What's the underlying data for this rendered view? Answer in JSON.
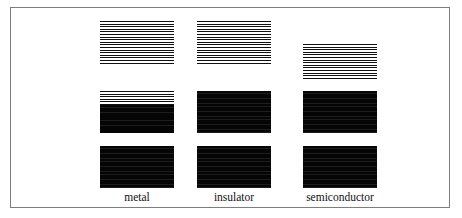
{
  "figure": {
    "type": "energy-band-diagram",
    "frame": {
      "border_color": "#7d7d7d",
      "background": "#ffffff"
    },
    "band_colors": {
      "filled": "#0a0a0a",
      "empty_lines": "#111111",
      "gap": "#ffffff"
    },
    "columns": [
      {
        "id": "metal",
        "label": "metal",
        "x": 89,
        "label_y": 183,
        "bands": [
          {
            "name": "conduction-band",
            "y": 13,
            "height": 44,
            "fill": "empty",
            "fill_fraction": 0.0,
            "stripe_count": 17
          },
          {
            "name": "partially-filled-band",
            "y": 83,
            "height": 42,
            "fill": "partial",
            "fill_fraction": 0.66,
            "stripe_count": 16
          },
          {
            "name": "valence-band",
            "y": 138,
            "height": 42,
            "fill": "filled",
            "fill_fraction": 1.0,
            "stripe_count": 16
          }
        ]
      },
      {
        "id": "insulator",
        "label": "insulator",
        "x": 186,
        "label_y": 183,
        "bands": [
          {
            "name": "conduction-band",
            "y": 13,
            "height": 44,
            "fill": "empty",
            "fill_fraction": 0.0,
            "stripe_count": 17
          },
          {
            "name": "valence-band",
            "y": 83,
            "height": 42,
            "fill": "filled",
            "fill_fraction": 1.0,
            "stripe_count": 16
          },
          {
            "name": "lower-band",
            "y": 138,
            "height": 42,
            "fill": "filled",
            "fill_fraction": 1.0,
            "stripe_count": 16
          }
        ]
      },
      {
        "id": "semiconductor",
        "label": "semiconductor",
        "x": 292,
        "label_y": 183,
        "bands": [
          {
            "name": "conduction-band",
            "y": 36,
            "height": 35,
            "fill": "empty",
            "fill_fraction": 0.0,
            "stripe_count": 14
          },
          {
            "name": "valence-band",
            "y": 83,
            "height": 42,
            "fill": "filled",
            "fill_fraction": 1.0,
            "stripe_count": 16
          },
          {
            "name": "lower-band",
            "y": 138,
            "height": 42,
            "fill": "filled",
            "fill_fraction": 1.0,
            "stripe_count": 16
          }
        ]
      }
    ]
  },
  "labels": {
    "metal": "metal",
    "insulator": "insulator",
    "semiconductor": "semiconductor"
  }
}
